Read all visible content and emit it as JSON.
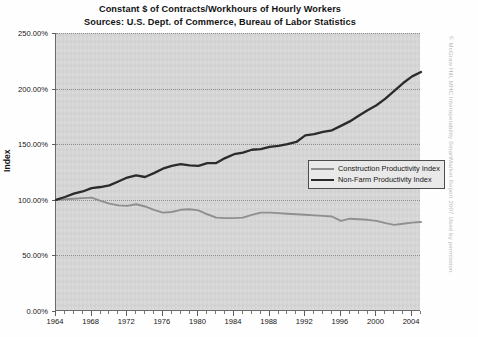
{
  "chart_data": {
    "type": "line",
    "title": "Constant $ of Contracts/Workhours of Hourly Workers",
    "subtitle": "Sources: U.S. Dept. of Commerce, Bureau of Labor Statistics",
    "xlabel": "",
    "ylabel": "Index",
    "ylim": [
      0,
      250
    ],
    "xlim": [
      1964,
      2005
    ],
    "grid": true,
    "legend_position": "center-right",
    "y_tick_labels": [
      "250.00%",
      "200.00%",
      "150.00%",
      "100.00%",
      "50.00%",
      "0.00%"
    ],
    "y_ticks": [
      250,
      200,
      150,
      100,
      50,
      0
    ],
    "x_tick_labels": [
      "1964",
      "1968",
      "1972",
      "1976",
      "1980",
      "1984",
      "1988",
      "1992",
      "1996",
      "2000",
      "2004"
    ],
    "x_ticks": [
      1964,
      1968,
      1972,
      1976,
      1980,
      1984,
      1988,
      1992,
      1996,
      2000,
      2004
    ],
    "x": [
      1964,
      1965,
      1966,
      1967,
      1968,
      1969,
      1970,
      1971,
      1972,
      1973,
      1974,
      1975,
      1976,
      1977,
      1978,
      1979,
      1980,
      1981,
      1982,
      1983,
      1984,
      1985,
      1986,
      1987,
      1988,
      1989,
      1990,
      1991,
      1992,
      1993,
      1994,
      1995,
      1996,
      1997,
      1998,
      1999,
      2000,
      2001,
      2002,
      2003,
      2004,
      2005
    ],
    "series": [
      {
        "name": "Construction Productivity Index",
        "color": "#8f8f8f",
        "values": [
          100.0,
          100.5,
          101.0,
          101.5,
          102.0,
          99.0,
          96.5,
          95.0,
          94.5,
          96.0,
          94.0,
          91.0,
          88.5,
          89.0,
          91.0,
          91.5,
          90.5,
          87.0,
          84.0,
          83.5,
          83.5,
          84.0,
          86.5,
          88.5,
          88.5,
          88.0,
          87.5,
          87.0,
          86.5,
          86.0,
          85.5,
          85.0,
          81.0,
          83.0,
          82.5,
          82.0,
          81.0,
          79.0,
          77.5,
          78.5,
          79.5,
          80.0
        ]
      },
      {
        "name": "Non-Farm Productivity Index",
        "color": "#2b2b2b",
        "values": [
          100.0,
          102.5,
          105.5,
          107.5,
          110.5,
          111.5,
          113.0,
          116.5,
          120.0,
          122.0,
          120.5,
          124.0,
          128.0,
          130.5,
          132.0,
          131.0,
          130.5,
          133.0,
          133.0,
          137.5,
          141.0,
          142.5,
          145.0,
          145.5,
          147.5,
          148.5,
          150.0,
          152.0,
          158.0,
          159.0,
          161.0,
          162.5,
          166.5,
          170.5,
          175.5,
          180.5,
          185.0,
          191.0,
          198.0,
          205.0,
          211.0,
          215.0
        ]
      }
    ]
  },
  "credit": {
    "text": "© McGraw Hill, MHC Interoperability SmartMarket Report 2007 Used by permission."
  }
}
